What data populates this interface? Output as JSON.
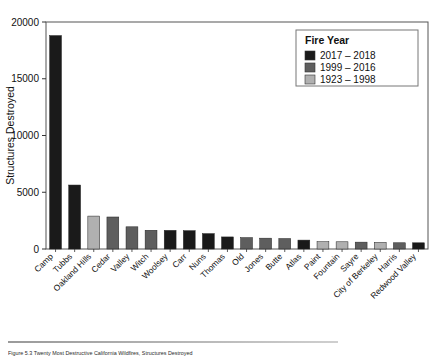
{
  "figure": {
    "caption": "Figure 5.3 Twenty Most Destructive California Wildfires, Structures Destroyed"
  },
  "chart_data": {
    "type": "bar",
    "title": "",
    "xlabel": "",
    "ylabel": "Structures Destroyed",
    "ylim": [
      0,
      20000
    ],
    "yticks": [
      0,
      5000,
      10000,
      15000,
      20000
    ],
    "ytick_labels": [
      "0",
      "5000",
      "10000",
      "15000",
      "20000"
    ],
    "grid": false,
    "legend": {
      "title": "Fire Year",
      "position": "top-right",
      "entries": [
        {
          "label": "2017 – 2018",
          "color": "#1a1a1a"
        },
        {
          "label": "1999 – 2016",
          "color": "#5e5e5e"
        },
        {
          "label": "1923 – 1998",
          "color": "#b0b0b0"
        }
      ]
    },
    "categories": [
      "Camp",
      "Tubbs",
      "Oakland Hills",
      "Cedar",
      "Valley",
      "Witch",
      "Woolsey",
      "Carr",
      "Nuns",
      "Thomas",
      "Old",
      "Jones",
      "Butte",
      "Atlas",
      "Paint",
      "Fountain",
      "Sayre",
      "City of Berkeley",
      "Harris",
      "Redwood Valley"
    ],
    "values": [
      18804,
      5636,
      2900,
      2820,
      1955,
      1650,
      1643,
      1614,
      1355,
      1063,
      1003,
      954,
      921,
      783,
      641,
      636,
      604,
      584,
      548,
      546
    ],
    "groups": [
      "2017 – 2018",
      "2017 – 2018",
      "1923 – 1998",
      "1999 – 2016",
      "1999 – 2016",
      "1999 – 2016",
      "2017 – 2018",
      "2017 – 2018",
      "2017 – 2018",
      "2017 – 2018",
      "1999 – 2016",
      "1999 – 2016",
      "1999 – 2016",
      "2017 – 2018",
      "1923 – 1998",
      "1923 – 1998",
      "1999 – 2016",
      "1923 – 1998",
      "1999 – 2016",
      "2017 – 2018"
    ]
  }
}
